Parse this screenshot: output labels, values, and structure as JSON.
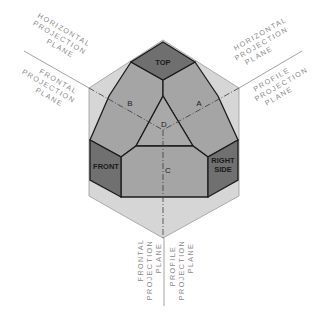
{
  "diagram": {
    "title": "",
    "faces": {
      "top": "TOP",
      "front": "FRONT",
      "right_side_line1": "RIGHT",
      "right_side_line2": "SIDE",
      "a": "A",
      "b": "B",
      "c": "C",
      "d": "D"
    },
    "labels": {
      "upper_left_horizontal": [
        "HORIZONTAL",
        "PROJECTION",
        "PLANE"
      ],
      "upper_left_frontal": [
        "FRONTAL",
        "PROJECTION",
        "PLANE"
      ],
      "upper_right_horizontal": [
        "HORIZONTAL",
        "PROJECTION",
        "PLANE"
      ],
      "upper_right_profile": [
        "PROFILE",
        "PROJECTION",
        "PLANE"
      ],
      "bottom_frontal": [
        "FRONTAL",
        "PROJECTION",
        "PLANE"
      ],
      "bottom_profile": [
        "PROFILE",
        "PROJECTION",
        "PLANE"
      ]
    },
    "colors": {
      "plane_light": "#d4d4d4",
      "face_mid": "#a3a3a3",
      "face_dark": "#6f6f6f",
      "edge": "#1c1c1c",
      "label_text": "#8a8a8a"
    }
  }
}
